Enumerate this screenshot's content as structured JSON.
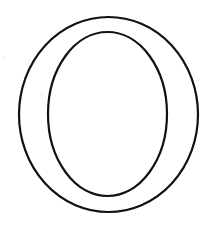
{
  "figure": {
    "glyph": "O",
    "style": "outline",
    "stroke_color": "#111111",
    "background_color": "#ffffff",
    "outer_ellipse": {
      "cx": 108.5,
      "cy": 114.5,
      "rx": 89.5,
      "ry": 97.5,
      "stroke_width": 2.2
    },
    "inner_ellipse": {
      "cx": 107.5,
      "cy": 114,
      "rx": 59.5,
      "ry": 82,
      "stroke_width": 2.2
    }
  }
}
